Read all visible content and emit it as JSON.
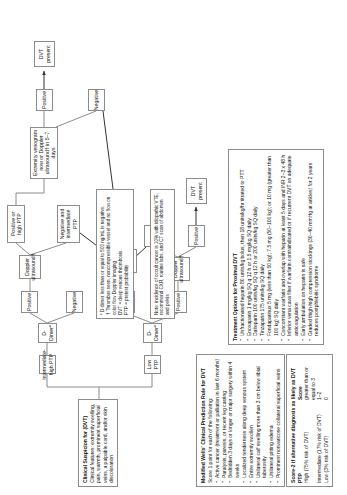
{
  "diagram": {
    "nodes": {
      "clinical_suspicion": {
        "title": "Clinical Suspicion for (DVT)",
        "body": "Clinical features: extremity swelling, pain, warmth, prominent superficial veins, a palpable cord, and/or skin discoloration"
      },
      "low_ptp": "Low PTP",
      "intermediate_high_ptp": "Intermediate-high PTP",
      "d_dimer_low": "D-Dimer*",
      "d_dimer_branch": "D-Dimer*",
      "doppler_us_low": "Doppler ultrasound†",
      "doppler_us_high": "Doppler ultrasound†",
      "dvt_excluded": "DVT excluded",
      "dvt_present_a": "DVT present",
      "dvt_present_b": "DVT present",
      "dvt_present_c": "DVT present",
      "positive_a": "Positive",
      "positive_b": "Positive",
      "positive_c": "Positive",
      "negative_a": "Negative",
      "negative_b": "Negative",
      "negative_c": "Negative",
      "pos_or_high_ptp": "Positive or high PTP",
      "neg_and_intermediate_ptp": "Negative and intermediate PTP",
      "venogram": "Extremity venogram now or Doppler ultrasound† in 5–7 days"
    },
    "wells_panel": {
      "title": "Modified Wells' Clinical Prediction Rule for DVT",
      "subtitle": "Score 1 point for each of the following:",
      "items": [
        "Active cancer (treatment or palliation in last 6 months)",
        "Paralysis, paresis, or recent leg casting",
        "Bedridden 3 days or longer or major surgery within 4 weeks",
        "Localized tenderness along deep venous system",
        "Entire extremity swollen",
        "Unilateral calf swelling more than 3 cm below tibial tuberosity",
        "Unilateral pitting edema",
        "Prominent nonvaricose collateral superficial veins"
      ]
    },
    "score_panel": {
      "title": "Score-2 if alternative diagnosis as likely as DVT",
      "header": {
        "ptp": "PTP",
        "score": "Score"
      },
      "rows": [
        {
          "ptp": "High (75% risk of DVT)",
          "score": "greater than or equal to 3"
        },
        {
          "ptp": "Intermediate (17% risk of DVT)",
          "score": "1–2"
        },
        {
          "ptp": "Low (3% risk of DVT)",
          "score": "0"
        }
      ]
    },
    "treatment_panel": {
      "title": "Treatment Options for Proximal DVT",
      "items": [
        "Unfractionated heparin 80 units/kg bolus, then 18 units/kg/hr titrated to PTT",
        "Enoxaparin 1 mg/kg SQ q 12 h or 1.5 mg/kg SQ daily",
        "Dalteparin 100 units/kg SQ q 12 h or 200 units/kg SQ daily",
        "Tinzaparin 175 units/kg SQ daily",
        "Fondaparinux 5 mg (less than 50 kg); 7.5 mg (50–100 kg); or 10 mg (greater than 100 kg) SQ daily",
        "Concomitant warfarin and overlap with heparin at least 5 days and INR 2–3 x 48 h",
        "Inferior vena cava filter if warfarin contraindicated or if recurrent DVT on adequate anticoagulation",
        "Early ambulation on heparin is safe",
        "Graded thigh-high compression stockings (30–40 mmHg at ankles) for 2 years reduces postphlebitic syndrome"
      ]
    },
    "footnotes": {
      "abbrev": [
        "* D-dimer less than or equal to 500 ng/mL is negative.",
        "† Thrombus seen, noncompressible vessel and no flow on color flow Doppler imaging",
        "DVT = deep venous thrombosis.",
        "PTP = pretest probability"
      ],
      "note": "Note: incidence of occult cancer is 10% with idiopathic VTE; recommend CXR, routine labs, and CT scan of abdomen and pelvis"
    }
  },
  "colors": {
    "border": "#8c8c8c",
    "text": "#111111",
    "background": "#ffffff"
  }
}
